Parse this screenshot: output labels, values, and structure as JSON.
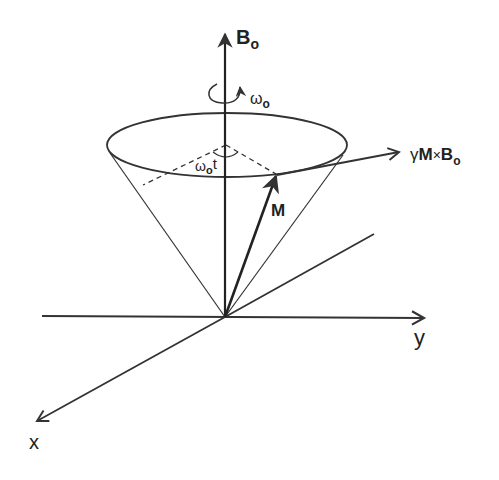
{
  "figure": {
    "colors": {
      "line": "#333333",
      "text": "#222222",
      "background": "#ffffff"
    }
  },
  "labels": {
    "b0_axis": {
      "main": "B",
      "sub": "o"
    },
    "omega_rotation": {
      "main": "ω",
      "sub": "o"
    },
    "omega_t": {
      "main": "ω",
      "sub": "o",
      "suffix": "t"
    },
    "magnetization": "M",
    "torque": {
      "prefix": "γ",
      "m": "M",
      "cross": "×",
      "b": "B",
      "sub": "o"
    },
    "y_axis": "y",
    "x_axis": "x"
  },
  "elements": {
    "axes": [
      "x",
      "y",
      "B0 (z)"
    ],
    "vectors": [
      "M",
      "γM×B0"
    ],
    "cone": "precession cone",
    "angle": "ω0 t"
  }
}
